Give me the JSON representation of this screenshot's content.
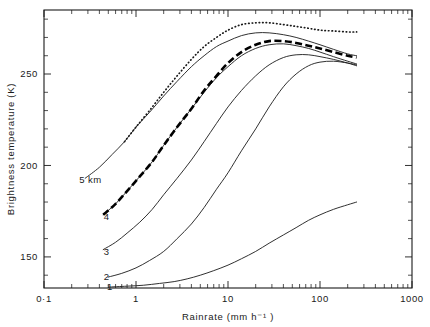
{
  "chart_data": {
    "type": "line",
    "title": "",
    "xlabel": "Rainrate  (mm  h⁻¹ )",
    "ylabel": "Brightness  temperature  (K)",
    "xscale": "log",
    "xlim": [
      0.1,
      1000
    ],
    "ylim": [
      133,
      285
    ],
    "grid": false,
    "legend_position": "inline-curve-labels",
    "xticks": [
      {
        "value": 0.1,
        "label": "0·1"
      },
      {
        "value": 1,
        "label": "1"
      },
      {
        "value": 10,
        "label": "10"
      },
      {
        "value": 100,
        "label": "100"
      },
      {
        "value": 1000,
        "label": "1000"
      }
    ],
    "yticks": [
      {
        "value": 150,
        "label": "150"
      },
      {
        "value": 200,
        "label": "200"
      },
      {
        "value": 250,
        "label": "250"
      }
    ],
    "y_minor_step": 10,
    "annotations": [
      {
        "text": "5 km",
        "x": 0.32,
        "y": 192,
        "series": "5 km"
      },
      {
        "text": "4",
        "x": 0.48,
        "y": 172,
        "series": "4"
      },
      {
        "text": "3",
        "x": 0.48,
        "y": 153,
        "series": "3"
      },
      {
        "text": "2",
        "x": 0.48,
        "y": 139,
        "series": "2"
      },
      {
        "text": "1",
        "x": 0.52,
        "y": 134,
        "series": "1"
      }
    ],
    "series": [
      {
        "name": "5 km",
        "style": "solid",
        "x": [
          0.28,
          0.4,
          0.55,
          0.75,
          1.0,
          1.4,
          2.0,
          2.8,
          4.0,
          5.5,
          7.5,
          10,
          14,
          20,
          28,
          40,
          55,
          75,
          100,
          140,
          200,
          250
        ],
        "values": [
          193,
          199,
          206,
          213,
          221,
          229,
          238,
          246,
          254,
          260,
          265,
          268,
          271,
          272.5,
          272.5,
          271.5,
          270,
          268,
          266,
          263.5,
          261,
          260
        ]
      },
      {
        "name": "4",
        "style": "solid",
        "x": [
          0.44,
          0.6,
          0.8,
          1.1,
          1.5,
          2.0,
          2.8,
          4.0,
          5.5,
          7.5,
          10,
          14,
          20,
          28,
          40,
          55,
          75,
          100,
          140,
          200,
          250
        ],
        "values": [
          173,
          179,
          186,
          194,
          202,
          211,
          221,
          231,
          240,
          248,
          254,
          260,
          264,
          266,
          266.5,
          265.5,
          264,
          262,
          259.5,
          257,
          255.5
        ]
      },
      {
        "name": "3",
        "style": "solid",
        "x": [
          0.44,
          0.6,
          0.8,
          1.1,
          1.5,
          2.0,
          2.8,
          4.0,
          5.5,
          7.5,
          10,
          14,
          20,
          28,
          40,
          55,
          75,
          100,
          140,
          200,
          250
        ],
        "values": [
          154,
          158,
          163,
          169,
          176,
          184,
          193,
          203,
          213,
          223,
          232,
          241,
          249,
          255,
          259,
          260.5,
          260.5,
          259.5,
          258,
          256,
          254.5
        ]
      },
      {
        "name": "2",
        "style": "solid",
        "x": [
          0.5,
          0.7,
          1.0,
          1.4,
          2.0,
          2.8,
          4.0,
          5.5,
          7.5,
          10,
          14,
          20,
          28,
          40,
          55,
          75,
          100,
          140,
          200,
          250
        ],
        "values": [
          139,
          141,
          144,
          148,
          153,
          160,
          168,
          177,
          187,
          196,
          208,
          220,
          232,
          243,
          250,
          254.5,
          256.5,
          257,
          256,
          255
        ]
      },
      {
        "name": "1",
        "style": "solid",
        "x": [
          0.5,
          0.8,
          1.2,
          1.8,
          2.6,
          3.6,
          5.0,
          7.0,
          10,
          14,
          20,
          28,
          40,
          55,
          75,
          100,
          140,
          200,
          250
        ],
        "values": [
          133.5,
          134,
          134.5,
          135.5,
          136.5,
          138,
          140,
          142.5,
          145.5,
          149,
          153,
          157.5,
          162,
          166,
          170,
          173,
          176,
          178.5,
          180
        ]
      },
      {
        "name": "dotted-upper",
        "style": "dotted",
        "x": [
          0.75,
          1.0,
          1.4,
          2.0,
          2.8,
          4.0,
          5.5,
          7.5,
          10,
          14,
          20,
          28,
          40,
          55,
          75,
          100,
          140,
          200,
          250
        ],
        "values": [
          213,
          221,
          230,
          240,
          249,
          258,
          265,
          270,
          274,
          277,
          278,
          278,
          277,
          276,
          275,
          274,
          273.5,
          273,
          273
        ]
      },
      {
        "name": "dashed-thick",
        "style": "dashed",
        "x": [
          0.44,
          0.6,
          0.8,
          1.1,
          1.5,
          2.0,
          2.8,
          4.0,
          5.5,
          7.5,
          10,
          14,
          20,
          28,
          40,
          55,
          75,
          100,
          140,
          200,
          250
        ],
        "values": [
          173,
          179,
          186,
          194,
          202,
          211,
          221,
          231,
          241,
          249,
          256,
          262,
          266,
          268,
          268,
          267,
          265.5,
          264,
          262,
          260,
          259
        ]
      }
    ]
  }
}
